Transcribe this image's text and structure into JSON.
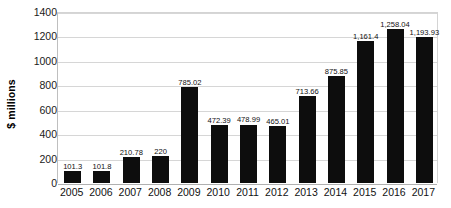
{
  "chart_data": {
    "type": "bar",
    "title": "",
    "xlabel": "",
    "ylabel": "$ millions",
    "ylim": [
      0,
      1400
    ],
    "ytick_step": 200,
    "yticks": [
      "1400",
      "1200",
      "1000",
      "800",
      "600",
      "400",
      "200",
      "0"
    ],
    "grid": true,
    "legend": "none",
    "bar_color": "#0d0d0d",
    "gridline_color": "#d6d6d6",
    "categories": [
      "2005",
      "2006",
      "2007",
      "2008",
      "2009",
      "2010",
      "2011",
      "2012",
      "2013",
      "2014",
      "2015",
      "2016",
      "2017"
    ],
    "values": [
      101.3,
      101.8,
      210.78,
      220,
      785.02,
      472.39,
      478.99,
      465.01,
      713.66,
      875.85,
      1161.4,
      1258.04,
      1193.93
    ],
    "data_labels": [
      "101.3",
      "101.8",
      "210.78",
      "220",
      "785.02",
      "472.39",
      "478.99",
      "465.01",
      "713.66",
      "875.85",
      "1,161.4",
      "1,258.04",
      "1,193.93"
    ]
  }
}
